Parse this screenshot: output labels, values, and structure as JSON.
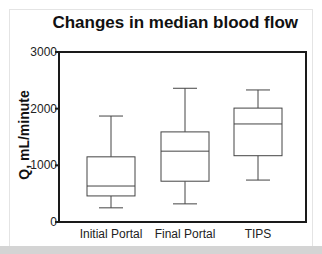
{
  "chart_data": {
    "type": "box",
    "title": "Changes in median blood flow",
    "xlabel": "",
    "ylabel": "Q, mL/minute",
    "ylim": [
      0,
      3000
    ],
    "yticks": [
      0,
      1000,
      2000,
      3000
    ],
    "ytick_labels": [
      "0",
      "1000",
      "2000",
      "3000"
    ],
    "grid": false,
    "legend": null,
    "categories": [
      "Initial Portal",
      "Final Portal",
      "TIPS"
    ],
    "series": [
      {
        "name": "Initial Portal",
        "whisker_low": 250,
        "q1": 460,
        "median": 635,
        "q3": 1150,
        "whisker_high": 1870
      },
      {
        "name": "Final Portal",
        "whisker_low": 320,
        "q1": 720,
        "median": 1250,
        "q3": 1590,
        "whisker_high": 2360
      },
      {
        "name": "TIPS",
        "whisker_low": 740,
        "q1": 1170,
        "median": 1730,
        "q3": 2010,
        "whisker_high": 2330
      }
    ]
  },
  "colors": {
    "axis": "#1a1a1a",
    "box_stroke": "#444444",
    "text": "#111111",
    "background": "#ffffff",
    "bottom_band": "#d4d4d4"
  }
}
